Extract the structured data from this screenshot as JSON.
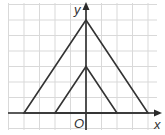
{
  "figure": {
    "axes": {
      "x_label": "x",
      "y_label": "y",
      "origin_label": "O"
    },
    "grid": {
      "x_range": [
        -5,
        4
      ],
      "y_range": [
        -1,
        7
      ],
      "unit": 1
    },
    "shapes": [
      {
        "name": "large-triangle",
        "vertices": [
          [
            -4,
            0
          ],
          [
            0,
            6
          ],
          [
            4,
            0
          ]
        ]
      },
      {
        "name": "small-triangle",
        "vertices": [
          [
            -2,
            0
          ],
          [
            0,
            3
          ],
          [
            2,
            0
          ]
        ]
      }
    ],
    "colors": {
      "grid": "#d9d9d9",
      "lines": "#333333",
      "background": "#ffffff"
    }
  }
}
